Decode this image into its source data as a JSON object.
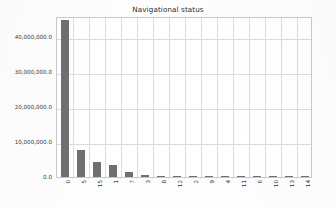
{
  "chart_data": {
    "type": "bar",
    "title": "Navigational status",
    "xlabel": "",
    "ylabel": "",
    "categories": [
      "0",
      "5",
      "15",
      "1",
      "7",
      "3",
      "8",
      "12",
      "2",
      "9",
      "4",
      "11",
      "6",
      "10",
      "13",
      "14"
    ],
    "values": [
      45000000,
      7800000,
      4300000,
      3300000,
      1500000,
      620000,
      420000,
      180000,
      40000,
      25000,
      15000,
      9000,
      6000,
      4000,
      2000,
      1000
    ],
    "ylim": [
      0,
      46000000
    ],
    "yticks": [
      0,
      10000000,
      20000000,
      30000000,
      40000000
    ],
    "ytick_labels": [
      "0.0",
      "10,000,000.0",
      "20,000,000.0",
      "30,000,000.0",
      "40,000,000.0"
    ],
    "grid": true,
    "grid_axis": "both",
    "legend": false,
    "bar_color": "#6f6f6f",
    "grid_color": "#dcdcdc",
    "plot_background": "#ffffff",
    "figure_background": "#fdfdfd",
    "xtick_rotation": 90
  }
}
